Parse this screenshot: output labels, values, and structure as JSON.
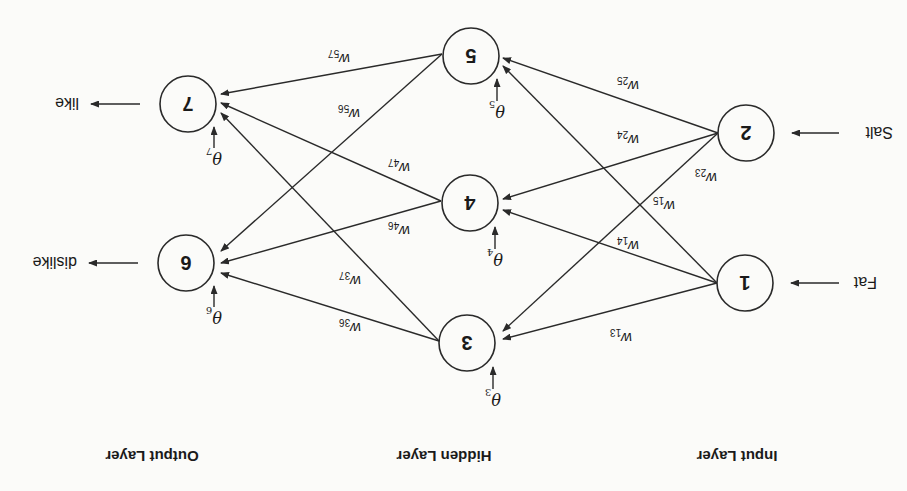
{
  "diagram": {
    "type": "feedforward-neural-network",
    "orientation": "rotated-180",
    "colors": {
      "background": "#fbfbf9",
      "ink": "#2a2a2a"
    },
    "layers": [
      {
        "id": "input",
        "label": "Input Layer"
      },
      {
        "id": "hidden",
        "label": "Hidden Layer"
      },
      {
        "id": "output",
        "label": "Output Layer"
      }
    ],
    "nodes": [
      {
        "id": "1",
        "label": "1",
        "layer": "input"
      },
      {
        "id": "2",
        "label": "2",
        "layer": "input"
      },
      {
        "id": "3",
        "label": "3",
        "layer": "hidden"
      },
      {
        "id": "4",
        "label": "4",
        "layer": "hidden"
      },
      {
        "id": "5",
        "label": "5",
        "layer": "hidden"
      },
      {
        "id": "6",
        "label": "6",
        "layer": "output"
      },
      {
        "id": "7",
        "label": "7",
        "layer": "output"
      }
    ],
    "inputs": [
      {
        "node": "1",
        "label": "Fat"
      },
      {
        "node": "2",
        "label": "Salt"
      }
    ],
    "outputs": [
      {
        "node": "6",
        "label": "dislike"
      },
      {
        "node": "7",
        "label": "like"
      }
    ],
    "biases": [
      {
        "node": "3",
        "symbol": "θ",
        "sub": "3"
      },
      {
        "node": "4",
        "symbol": "θ",
        "sub": "4"
      },
      {
        "node": "5",
        "symbol": "θ",
        "sub": "5"
      },
      {
        "node": "6",
        "symbol": "θ",
        "sub": "6"
      },
      {
        "node": "7",
        "symbol": "θ",
        "sub": "7"
      }
    ],
    "edges": [
      {
        "from": "1",
        "to": "3",
        "w": "w",
        "sub": "13"
      },
      {
        "from": "1",
        "to": "4",
        "w": "w",
        "sub": "14"
      },
      {
        "from": "1",
        "to": "5",
        "w": "w",
        "sub": "15"
      },
      {
        "from": "2",
        "to": "3",
        "w": "w",
        "sub": "23"
      },
      {
        "from": "2",
        "to": "4",
        "w": "w",
        "sub": "24"
      },
      {
        "from": "2",
        "to": "5",
        "w": "w",
        "sub": "25"
      },
      {
        "from": "3",
        "to": "6",
        "w": "w",
        "sub": "36"
      },
      {
        "from": "3",
        "to": "7",
        "w": "w",
        "sub": "37"
      },
      {
        "from": "4",
        "to": "6",
        "w": "w",
        "sub": "46"
      },
      {
        "from": "4",
        "to": "7",
        "w": "w",
        "sub": "47"
      },
      {
        "from": "5",
        "to": "6",
        "w": "w",
        "sub": "56"
      },
      {
        "from": "5",
        "to": "7",
        "w": "w",
        "sub": "57"
      }
    ]
  }
}
